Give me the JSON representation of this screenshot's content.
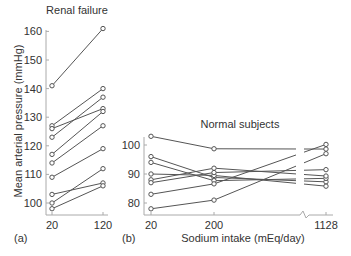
{
  "chart_data": [
    {
      "type": "line",
      "panel_label": "(a)",
      "title": "Renal failure",
      "xlabel": "",
      "ylabel": "Mean arterial pressure (mmHg)",
      "categories": [
        "20",
        "120"
      ],
      "ylim": [
        95,
        162
      ],
      "yticks": [
        100,
        110,
        120,
        130,
        140,
        150,
        160
      ],
      "series": [
        {
          "name": "subject-1",
          "values": [
            141,
            161
          ]
        },
        {
          "name": "subject-2",
          "values": [
            127,
            140
          ]
        },
        {
          "name": "subject-3",
          "values": [
            126,
            133
          ]
        },
        {
          "name": "subject-4",
          "values": [
            123,
            137
          ]
        },
        {
          "name": "subject-5",
          "values": [
            117,
            132
          ]
        },
        {
          "name": "subject-6",
          "values": [
            114,
            127
          ]
        },
        {
          "name": "subject-7",
          "values": [
            109,
            119
          ]
        },
        {
          "name": "subject-8",
          "values": [
            103,
            107
          ]
        },
        {
          "name": "subject-9",
          "values": [
            100,
            112
          ]
        },
        {
          "name": "subject-10",
          "values": [
            98,
            106
          ]
        }
      ]
    },
    {
      "type": "line",
      "panel_label": "(b)",
      "title": "Normal subjects",
      "xlabel": "Sodium intake (mEq/day)",
      "ylabel": "",
      "categories": [
        "20",
        "200",
        "1128"
      ],
      "axis_break_before": "1128",
      "ylim": [
        76,
        105
      ],
      "yticks": [
        80,
        90,
        100
      ],
      "series": [
        {
          "name": "subject-1",
          "values": [
            103,
            98.7,
            98.6
          ]
        },
        {
          "name": "subject-2",
          "values": [
            96,
            88.8,
            87.3
          ]
        },
        {
          "name": "subject-3",
          "values": [
            94,
            87.7,
            88.5
          ]
        },
        {
          "name": "subject-4",
          "values": [
            90,
            89.5,
            85.8
          ]
        },
        {
          "name": "subject-5",
          "values": [
            88,
            92,
            89.3
          ]
        },
        {
          "name": "subject-6",
          "values": [
            87,
            90.5,
            91.5
          ]
        },
        {
          "name": "subject-7",
          "values": [
            83,
            86.6,
            100.2
          ]
        },
        {
          "name": "subject-8",
          "values": [
            78,
            81,
            97
          ]
        }
      ]
    }
  ],
  "colors": {
    "line": "#555555",
    "axis": "#aaaaaa",
    "text": "#333333"
  }
}
